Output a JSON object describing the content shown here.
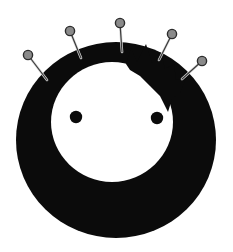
{
  "canvas": {
    "width": 233,
    "height": 252,
    "background_color": "#ffffff",
    "title": "Pin cushion face"
  },
  "palette": {
    "ink": "#0b0b0b",
    "paper": "#ffffff",
    "pin_head_fill": "#8a8a8a",
    "pin_head_stroke": "#2c2c2c",
    "pin_stem": "#3a3a3a",
    "pin_stem_highlight": "#d8d8d8"
  },
  "ring": {
    "name": "black-ring-body",
    "center_x": 116,
    "center_y": 140,
    "outer_radius_x": 100,
    "outer_radius_y": 98
  },
  "face": {
    "name": "inner-white-face",
    "center_x": 112,
    "center_y": 122,
    "radius_x": 61,
    "radius_y": 60,
    "outline_path": "M 112 62 C 145 62 173 89 173 122 C 173 155 145 182 112 182 C 79 182 51 155 51 122 C 51 89 79 62 112 62 Z",
    "crown_path": "M 126 64 L 131 48 L 137 62 L 146 44 L 152 63 L 161 52 L 165 69 L 174 64 L 176 80 L 186 78 L 180 93 L 172 99 L 168 112 L 160 96 L 150 86 L 140 76 L 130 70 Z"
  },
  "eyes": [
    {
      "name": "left-eye",
      "cx": 76,
      "cy": 117,
      "r": 6.2
    },
    {
      "name": "right-eye",
      "cx": 157,
      "cy": 118,
      "r": 6.2
    }
  ],
  "pins": [
    {
      "name": "pin-1-far-left",
      "head_cx": 28,
      "head_cy": 55,
      "head_r": 4.6,
      "tip_x": 47,
      "tip_y": 80,
      "angle_label": "down-right"
    },
    {
      "name": "pin-2-upper-left",
      "head_cx": 70,
      "head_cy": 31,
      "head_r": 4.6,
      "tip_x": 81,
      "tip_y": 58,
      "angle_label": "down-right-steep"
    },
    {
      "name": "pin-3-top-center",
      "head_cx": 120,
      "head_cy": 23,
      "head_r": 4.6,
      "tip_x": 122,
      "tip_y": 52,
      "angle_label": "vertical"
    },
    {
      "name": "pin-4-upper-right",
      "head_cx": 172,
      "head_cy": 34,
      "head_r": 4.6,
      "tip_x": 159,
      "tip_y": 60,
      "angle_label": "down-left-steep"
    },
    {
      "name": "pin-5-far-right",
      "head_cx": 202,
      "head_cy": 61,
      "head_r": 4.6,
      "tip_x": 182,
      "tip_y": 79,
      "angle_label": "down-left"
    }
  ],
  "accessibility": {
    "alt_text": "A thick black ring shaped like a round face with two dot eyes and a jagged crown on the upper right, with five gray pins stuck into its top edge."
  }
}
